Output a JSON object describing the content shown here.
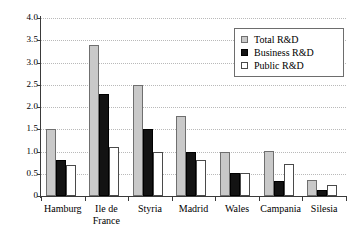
{
  "chart_data": {
    "type": "bar",
    "title": "",
    "subtitle": "",
    "xlabel": "",
    "ylabel": "",
    "ylim": [
      0,
      4.0
    ],
    "yticks": [
      "0",
      "0.5",
      "1.0",
      "1.5",
      "2.0",
      "2.5",
      "3.0",
      "3.5",
      "4.0"
    ],
    "ytick_values": [
      0,
      0.5,
      1.0,
      1.5,
      2.0,
      2.5,
      3.0,
      3.5,
      4.0
    ],
    "grid": true,
    "grid_axis": "y",
    "legend_position": "top-right",
    "categories": [
      "Hamburg",
      "Ile de\nFrance",
      "Styria",
      "Madrid",
      "Wales",
      "Campania",
      "Silesia"
    ],
    "series": [
      {
        "name": "Total R&D",
        "color": "#c9c9c9",
        "values": [
          1.5,
          3.4,
          2.5,
          1.8,
          1.0,
          1.01,
          0.35
        ]
      },
      {
        "name": "Business R&D",
        "color": "#131313",
        "values": [
          0.8,
          2.3,
          1.51,
          1.0,
          0.51,
          0.33,
          0.14
        ]
      },
      {
        "name": "Public R&D",
        "color": "#ffffff",
        "values": [
          0.7,
          1.1,
          1.0,
          0.81,
          0.51,
          0.72,
          0.24
        ]
      }
    ]
  },
  "legend": {
    "items": [
      {
        "label": "Total R&D",
        "swatch": "total"
      },
      {
        "label": "Business R&D",
        "swatch": "business"
      },
      {
        "label": "Public R&D",
        "swatch": "public"
      }
    ]
  }
}
